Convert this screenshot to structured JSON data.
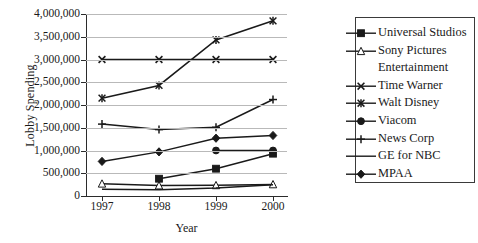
{
  "chart_data": {
    "type": "line",
    "title": "",
    "xlabel": "Year",
    "ylabel": "Lobby Spending",
    "categories": [
      "1997",
      "1998",
      "1999",
      "2000"
    ],
    "x": [
      1997,
      1998,
      1999,
      2000
    ],
    "ylim": [
      0,
      4000000
    ],
    "ytick_labels": [
      "0",
      "500,000",
      "1,000,000",
      "1,500,000",
      "2,000,000",
      "2,500,000",
      "3,000,000",
      "3,500,000",
      "4,000,000"
    ],
    "ytick_values": [
      0,
      500000,
      1000000,
      1500000,
      2000000,
      2500000,
      3000000,
      3500000,
      4000000
    ],
    "grid": true,
    "legend_position": "right",
    "series": [
      {
        "name": "Universal Studios",
        "marker": "filled-square",
        "values": [
          null,
          380000,
          600000,
          930000
        ]
      },
      {
        "name": "Sony Pictures Entertainment",
        "marker": "open-triangle",
        "values": [
          270000,
          230000,
          235000,
          255000
        ]
      },
      {
        "name": "Time Warner",
        "marker": "cross-x",
        "values": [
          3000000,
          3000000,
          3000000,
          3000000
        ]
      },
      {
        "name": "Walt Disney",
        "marker": "asterisk",
        "values": [
          2150000,
          2430000,
          3430000,
          3850000
        ]
      },
      {
        "name": "Viacom",
        "marker": "filled-circle",
        "values": [
          null,
          null,
          1000000,
          1000000
        ]
      },
      {
        "name": "News Corp",
        "marker": "plus",
        "values": [
          1580000,
          1460000,
          1510000,
          2120000
        ]
      },
      {
        "name": "GE for NBC",
        "marker": "none",
        "values": [
          150000,
          140000,
          175000,
          245000
        ]
      },
      {
        "name": "MPAA",
        "marker": "filled-diamond",
        "values": [
          760000,
          970000,
          1270000,
          1330000
        ]
      }
    ]
  },
  "legend": {
    "entries": [
      {
        "label": "Universal Studios",
        "marker": "filled-square",
        "continuation": ""
      },
      {
        "label": "Sony Pictures",
        "marker": "open-triangle",
        "continuation": "Entertainment"
      },
      {
        "label": "Time Warner",
        "marker": "cross-x",
        "continuation": ""
      },
      {
        "label": "Walt Disney",
        "marker": "asterisk",
        "continuation": ""
      },
      {
        "label": "Viacom",
        "marker": "filled-circle",
        "continuation": ""
      },
      {
        "label": "News Corp",
        "marker": "plus",
        "continuation": ""
      },
      {
        "label": "GE for NBC",
        "marker": "none",
        "continuation": ""
      },
      {
        "label": "MPAA",
        "marker": "filled-diamond",
        "continuation": ""
      }
    ]
  },
  "colors": {
    "line": "#1a1a1a",
    "grid": "#b9b9b9",
    "axis": "#2b2b2b",
    "background": "#ffffff"
  }
}
